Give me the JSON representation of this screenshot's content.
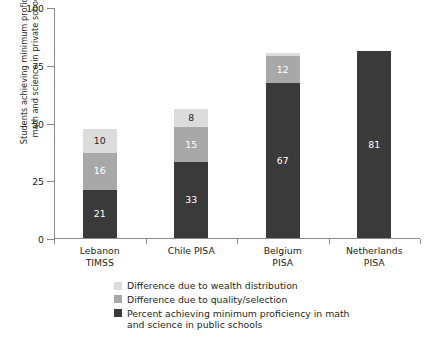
{
  "chart_data": {
    "type": "bar",
    "subtype": "stacked-bar",
    "title": "",
    "xlabel": "",
    "ylabel": "Students achieving minimum proficiency in math and science in private schools (%)",
    "ylabel_line1": "Students achieving minimum proficiency in",
    "ylabel_line2": "math and science in private schools (%)",
    "ylim": [
      0,
      100
    ],
    "yticks": [
      0,
      25,
      50,
      75,
      100
    ],
    "ytick_labels": [
      "0",
      "25",
      "50",
      "75",
      "100"
    ],
    "grid": false,
    "legend_position": "bottom",
    "categories": [
      "Lebanon TIMSS",
      "Chile PISA",
      "Belgium PISA",
      "Netherlands PISA"
    ],
    "category_lines": [
      [
        "Lebanon",
        "TIMSS"
      ],
      [
        "Chile PISA",
        ""
      ],
      [
        "Belgium",
        "PISA"
      ],
      [
        "Netherlands",
        "PISA"
      ]
    ],
    "series": [
      {
        "name": "Percent achieving minimum proficiency in math and science in public schools",
        "name_line1": "Percent achieving minimum proficiency in math",
        "name_line2": "and science in public schools",
        "color": "#3a3a3a",
        "values": [
          21,
          33,
          67,
          81
        ],
        "labels": [
          "21",
          "33",
          "67",
          "81"
        ]
      },
      {
        "name": "Difference due to quality/selection",
        "color": "#a8a8a8",
        "values": [
          16,
          15,
          12,
          0
        ],
        "labels": [
          "16",
          "15",
          "12",
          ""
        ]
      },
      {
        "name": "Difference due to wealth distribution",
        "color": "#dcdcdc",
        "values": [
          10,
          8,
          1,
          0
        ],
        "labels": [
          "10",
          "8",
          "",
          ""
        ]
      }
    ],
    "totals": [
      47,
      56,
      80,
      81
    ],
    "legend_order": [
      "Difference due to wealth distribution",
      "Difference due to quality/selection",
      "Percent achieving minimum proficiency in math and science in public schools"
    ]
  },
  "legend": {
    "items": [
      {
        "label": "Difference due to wealth distribution",
        "line1": "Difference due to wealth distribution",
        "line2": "",
        "color": "#dcdcdc"
      },
      {
        "label": "Difference due to quality/selection",
        "line1": "Difference due to quality/selection",
        "line2": "",
        "color": "#a8a8a8"
      },
      {
        "label": "Percent achieving minimum proficiency in math and science in public schools",
        "line1": "Percent achieving minimum proficiency in math",
        "line2": "and science in public schools",
        "color": "#3a3a3a"
      }
    ]
  },
  "colors": {
    "dark": "#3a3a3a",
    "medium": "#a8a8a8",
    "light": "#dcdcdc",
    "axis": "#8a8a8a",
    "text": "#231f20",
    "background": "#ffffff"
  }
}
